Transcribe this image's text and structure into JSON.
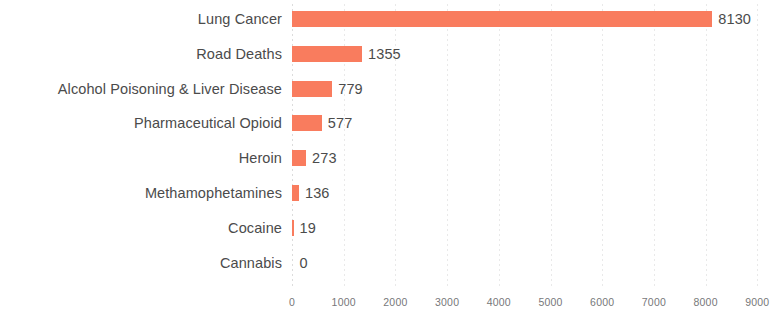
{
  "chart_data": {
    "type": "bar",
    "orientation": "horizontal",
    "title": "",
    "subtitle": "",
    "xlabel": "",
    "ylabel": "",
    "categories": [
      "Lung Cancer",
      "Road Deaths",
      "Alcohol Poisoning & Liver Disease",
      "Pharmaceutical Opioid",
      "Heroin",
      "Methamophetamines",
      "Cocaine",
      "Cannabis"
    ],
    "values": [
      8130,
      1355,
      779,
      577,
      273,
      136,
      19,
      0
    ],
    "value_labels": [
      "8130",
      "1355",
      "779",
      "577",
      "273",
      "136",
      "19",
      "0"
    ],
    "xlim": [
      0,
      9000
    ],
    "xticks": [
      0,
      1000,
      2000,
      3000,
      4000,
      5000,
      6000,
      7000,
      8000,
      9000
    ],
    "xtick_labels": [
      "0",
      "1000",
      "2000",
      "3000",
      "4000",
      "5000",
      "6000",
      "7000",
      "8000",
      "9000"
    ],
    "grid": "vertical-dotted",
    "legend": "none",
    "bar_color": "#f97c5e",
    "label_color": "#4b4b4b",
    "tick_color": "#77787a",
    "gridline_color": "#e9e9e9",
    "background_color": "#ffffff"
  }
}
